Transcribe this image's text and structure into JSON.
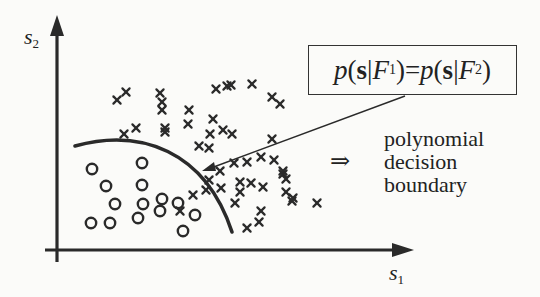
{
  "diagram": {
    "axes": {
      "x_label": {
        "var": "s",
        "sub": "1"
      },
      "y_label": {
        "var": "s",
        "sub": "2"
      }
    },
    "formula": {
      "lhs_p": "p",
      "lhs_open": " (",
      "lhs_vec": "s",
      "lhs_bar": "|",
      "lhs_F": "F",
      "lhs_sub": "1",
      "lhs_close": ")",
      "eq": " = ",
      "rhs_p": "p",
      "rhs_open": " (",
      "rhs_vec": "s",
      "rhs_bar": "|",
      "rhs_F": "F",
      "rhs_sub": "2",
      "rhs_close": ")"
    },
    "annotation": {
      "implies_symbol": "⇒",
      "lines": [
        "polynomial",
        "decision",
        "boundary"
      ]
    },
    "legend_semantics": {
      "class_F1_marker": "circle-icon",
      "class_F2_marker": "cross-icon"
    },
    "colors": {
      "background": "#fbfbf9",
      "ink": "#2a2a2a"
    }
  },
  "chart_data": {
    "type": "scatter",
    "title": "",
    "xlabel": "s1",
    "ylabel": "s2",
    "grid": false,
    "series": [
      {
        "name": "F1 (circles)",
        "marker": "o",
        "points_px": [
          [
            92,
            169
          ],
          [
            142,
            163
          ],
          [
            106,
            186
          ],
          [
            142,
            185
          ],
          [
            115,
            204
          ],
          [
            143,
            204
          ],
          [
            162,
            199
          ],
          [
            178,
            203
          ],
          [
            160,
            211
          ],
          [
            195,
            215
          ],
          [
            91,
            223
          ],
          [
            110,
            223
          ],
          [
            138,
            218
          ],
          [
            183,
            231
          ]
        ]
      },
      {
        "name": "F2 (crosses)",
        "marker": "x",
        "points_px": [
          [
            117,
            100
          ],
          [
            126,
            92
          ],
          [
            160,
            93
          ],
          [
            162,
            102
          ],
          [
            162,
            110
          ],
          [
            189,
            110
          ],
          [
            188,
            124
          ],
          [
            165,
            128
          ],
          [
            165,
            132
          ],
          [
            124,
            134
          ],
          [
            136,
            128
          ],
          [
            216,
            89
          ],
          [
            227,
            86
          ],
          [
            231,
            85
          ],
          [
            252,
            84
          ],
          [
            272,
            97
          ],
          [
            280,
            104
          ],
          [
            213,
            119
          ],
          [
            210,
            134
          ],
          [
            223,
            130
          ],
          [
            232,
            134
          ],
          [
            199,
            146
          ],
          [
            209,
            148
          ],
          [
            193,
            195
          ],
          [
            180,
            211
          ],
          [
            209,
            180
          ],
          [
            206,
            190
          ],
          [
            220,
            171
          ],
          [
            234,
            163
          ],
          [
            247,
            162
          ],
          [
            221,
            188
          ],
          [
            240,
            182
          ],
          [
            251,
            183
          ],
          [
            240,
            192
          ],
          [
            235,
            203
          ],
          [
            247,
            228
          ],
          [
            259,
            222
          ],
          [
            272,
            139
          ],
          [
            274,
            160
          ],
          [
            261,
            157
          ],
          [
            263,
            187
          ],
          [
            283,
            174
          ],
          [
            292,
            201
          ],
          [
            283,
            171
          ],
          [
            286,
            179
          ],
          [
            286,
            192
          ],
          [
            293,
            198
          ],
          [
            317,
            203
          ],
          [
            261,
            211
          ]
        ]
      }
    ],
    "decision_boundary": {
      "label": "p(s|F1) = p(s|F2)",
      "kind": "polynomial curve",
      "path_px": [
        [
          75,
          145
        ],
        [
          130,
          140
        ],
        [
          180,
          160
        ],
        [
          215,
          195
        ],
        [
          232,
          230
        ]
      ]
    },
    "axis_range_px": {
      "x": [
        48,
        414
      ],
      "y": [
        253,
        14
      ]
    }
  }
}
